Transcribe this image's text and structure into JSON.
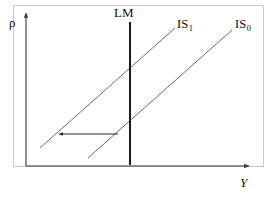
{
  "figure": {
    "type": "economics-diagram",
    "name": "IS-LM diagram with leftward IS shift",
    "background_color": "#ffffff",
    "frame_color": "#c9c9c9"
  },
  "axes": {
    "y_axis_label": "ρ",
    "x_axis_label": "Y",
    "axis_color": "#3a3a3a",
    "origin": {
      "x": 26,
      "y": 166
    },
    "y_axis_top": {
      "x": 26,
      "y": 12
    },
    "x_axis_right": {
      "x": 250,
      "y": 166
    },
    "arrowheads": true,
    "ticks": [],
    "gridlines": false
  },
  "curves": [
    {
      "id": "lm",
      "label": "LM",
      "label_sub": "",
      "color": "#1a1a1a",
      "stroke_width": 2.0,
      "orientation": "vertical",
      "from": {
        "x": 130,
        "y": 22
      },
      "to": {
        "x": 130,
        "y": 165
      }
    },
    {
      "id": "is1",
      "label": "IS",
      "label_sub": "1",
      "color": "#6b6b6b",
      "stroke_width": 1.0,
      "orientation": "upward-sloping",
      "from": {
        "x": 40,
        "y": 148
      },
      "to": {
        "x": 175,
        "y": 28
      }
    },
    {
      "id": "is0",
      "label": "IS",
      "label_sub": "0",
      "color": "#6b6b6b",
      "stroke_width": 1.0,
      "orientation": "upward-sloping",
      "from": {
        "x": 88,
        "y": 158
      },
      "to": {
        "x": 232,
        "y": 30
      }
    }
  ],
  "annotations": [
    {
      "id": "shift-arrow",
      "meaning": "leftward shift of IS curve",
      "direction": "left",
      "color": "#2a2a2a",
      "from": {
        "x": 118,
        "y": 134
      },
      "to": {
        "x": 58,
        "y": 134
      }
    }
  ],
  "labels": {
    "rho": "ρ",
    "lm": "LM",
    "is1_base": "IS",
    "is1_sub": "1",
    "is0_base": "IS",
    "is0_sub": "0",
    "y": "Y"
  }
}
